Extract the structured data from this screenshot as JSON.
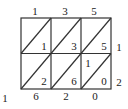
{
  "diagram": {
    "type": "lattice-multiplication",
    "multiplicand_digits": [
      "1",
      "3",
      "5"
    ],
    "multiplier_digits": [
      "1",
      "2"
    ],
    "cells": [
      [
        {
          "tens": "",
          "ones": "1"
        },
        {
          "tens": "",
          "ones": "3"
        },
        {
          "tens": "",
          "ones": "5"
        }
      ],
      [
        {
          "tens": "",
          "ones": "2"
        },
        {
          "tens": "",
          "ones": "6"
        },
        {
          "tens": "1",
          "ones": "0"
        }
      ]
    ],
    "result_digits_left": [
      "1"
    ],
    "result_digits_bottom": [
      "6",
      "2",
      "0"
    ]
  }
}
